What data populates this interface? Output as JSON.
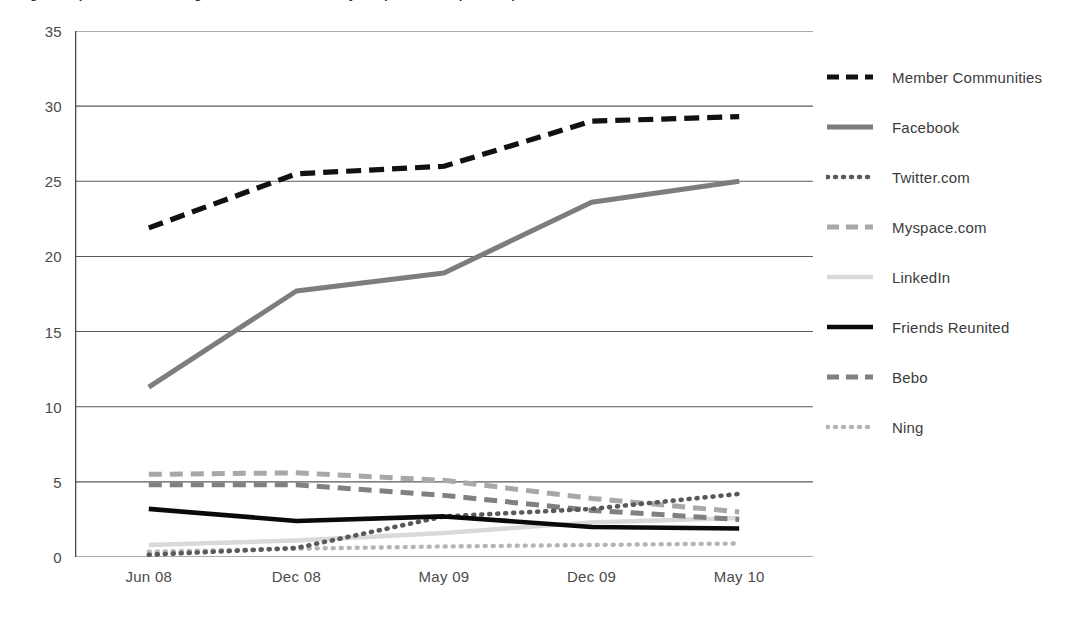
{
  "chart_data": {
    "type": "line",
    "title": "Fig 1.2  Top social networking sites in the UK, monthly unique visitors (millions)",
    "xlabel": "",
    "ylabel": "",
    "categories": [
      "Jun 08",
      "Dec 08",
      "May 09",
      "Dec 09",
      "May 10"
    ],
    "ylim": [
      0,
      35
    ],
    "yticks": [
      0,
      5,
      10,
      15,
      20,
      25,
      30,
      35
    ],
    "ytick_labels": [
      "0",
      "5",
      "10",
      "15",
      "20",
      "25",
      "30",
      "35"
    ],
    "grid": "horizontal",
    "legend_position": "right",
    "series": [
      {
        "name": "Member Communities",
        "values": [
          21.9,
          25.5,
          26.0,
          29.0,
          29.3
        ],
        "color": "#111111",
        "style": "dashed",
        "width": 5.2,
        "dash": "15,8"
      },
      {
        "name": "Facebook",
        "values": [
          11.3,
          17.7,
          18.9,
          23.6,
          25.0
        ],
        "color": "#7d7d7d",
        "style": "solid",
        "width": 5.0,
        "dash": "none"
      },
      {
        "name": "Twitter.com",
        "values": [
          0.15,
          0.6,
          2.7,
          3.2,
          4.2
        ],
        "color": "#595959",
        "style": "dotted",
        "width": 4.6,
        "dash": "1,7"
      },
      {
        "name": "Myspace.com",
        "values": [
          5.5,
          5.6,
          5.1,
          3.9,
          3.0
        ],
        "color": "#a8a8a8",
        "style": "dashed",
        "width": 5.0,
        "dash": "13,8"
      },
      {
        "name": "LinkedIn",
        "values": [
          0.8,
          1.1,
          1.6,
          2.3,
          2.6
        ],
        "color": "#d9d9d9",
        "style": "solid",
        "width": 4.4,
        "dash": "none"
      },
      {
        "name": "Friends Reunited",
        "values": [
          3.2,
          2.4,
          2.7,
          2.0,
          1.9
        ],
        "color": "#0a0a0a",
        "style": "solid",
        "width": 4.6,
        "dash": "none"
      },
      {
        "name": "Bebo",
        "values": [
          4.8,
          4.8,
          4.1,
          3.1,
          2.5
        ],
        "color": "#808080",
        "style": "dashed",
        "width": 5.0,
        "dash": "13,8"
      },
      {
        "name": "Ning",
        "values": [
          0.35,
          0.55,
          0.7,
          0.8,
          0.9
        ],
        "color": "#b5b5b5",
        "style": "dotted",
        "width": 4.4,
        "dash": "1,7"
      }
    ]
  },
  "legend": {
    "items": [
      {
        "label": "Member Communities"
      },
      {
        "label": "Facebook"
      },
      {
        "label": "Twitter.com"
      },
      {
        "label": "Myspace.com"
      },
      {
        "label": "LinkedIn"
      },
      {
        "label": "Friends Reunited"
      },
      {
        "label": "Bebo"
      },
      {
        "label": "Ning"
      }
    ]
  },
  "axes": {
    "y_tick_labels": [
      "35",
      "30",
      "25",
      "20",
      "15",
      "10",
      "5",
      "0"
    ],
    "x_tick_labels": [
      "Jun 08",
      "Dec 08",
      "May 09",
      "Dec 09",
      "May 10"
    ]
  }
}
